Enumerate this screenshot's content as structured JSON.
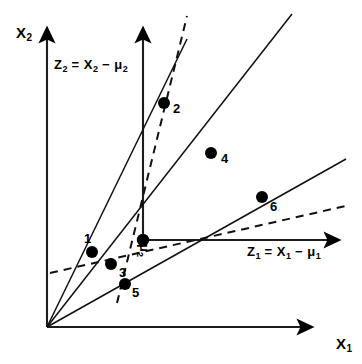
{
  "figure": {
    "background_color": "#ffffff",
    "stroke_color": "#000000",
    "point_color": "#000000"
  },
  "axes": {
    "x1": {
      "name": "X1",
      "label_main": "X",
      "label_sub": "1",
      "label_x": 336,
      "label_y": 336,
      "arrow_from": [
        47,
        327
      ],
      "arrow_to": [
        320,
        327
      ]
    },
    "x2": {
      "name": "X2",
      "label_main": "X",
      "label_sub": "2",
      "label_x": 16,
      "label_y": 25,
      "arrow_from": [
        47,
        327
      ],
      "arrow_to": [
        47,
        20
      ]
    },
    "z1": {
      "name": "Z1",
      "equation_parts": [
        "Z",
        "1",
        " = X",
        "1",
        " − μ",
        "1"
      ],
      "equation_text": "Z₁ = X₁ − μ₁",
      "label_x": 247,
      "label_y": 245,
      "arrow_from": [
        143,
        240
      ],
      "arrow_to": [
        347,
        240
      ]
    },
    "z2": {
      "name": "Z2",
      "equation_text": "Z₂ = X₂ − μ₂",
      "label_x": 54,
      "label_y": 58,
      "arrow_from": [
        143,
        240
      ],
      "arrow_to": [
        143,
        20
      ]
    }
  },
  "origin_marker": {
    "name": "mu-vector",
    "label_main": "μ",
    "label_sub": "2",
    "label_x": 148,
    "label_y": 247,
    "point": [
      143,
      240
    ]
  },
  "chart_data": {
    "type": "scatter",
    "xlabel": "X1",
    "ylabel": "X2",
    "grid": false,
    "legend": false,
    "points": [
      {
        "label": "1",
        "px": 92,
        "py": 252,
        "label_px": 84,
        "label_py": 232
      },
      {
        "label": "2",
        "px": 164,
        "py": 103,
        "label_px": 173,
        "label_py": 102
      },
      {
        "label": "3",
        "px": 111,
        "py": 264,
        "label_px": 119,
        "label_py": 266
      },
      {
        "label": "4",
        "px": 211,
        "py": 153,
        "label_px": 221,
        "label_py": 152
      },
      {
        "label": "5",
        "px": 125,
        "py": 284,
        "label_px": 132,
        "label_py": 286
      },
      {
        "label": "6",
        "px": 262,
        "py": 197,
        "label_px": 270,
        "label_py": 200
      }
    ],
    "point_radius": 6,
    "rays_from_x_origin": [
      {
        "name": "ray-to-point-2",
        "from": [
          47,
          327
        ],
        "to": [
          186,
          41
        ]
      },
      {
        "name": "ray-to-point-4",
        "from": [
          47,
          327
        ],
        "to": [
          290,
          16
        ]
      },
      {
        "name": "ray-to-point-6",
        "from": [
          47,
          327
        ],
        "to": [
          345,
          160
        ]
      }
    ],
    "solid_lines": [
      {
        "name": "line-through-1-2",
        "from": [
          47,
          327
        ],
        "to": [
          186,
          41
        ]
      },
      {
        "name": "line-through-4",
        "from": [
          47,
          327
        ],
        "to": [
          290,
          16
        ]
      },
      {
        "name": "line-through-3-6",
        "from": [
          47,
          327
        ],
        "to": [
          345,
          160
        ]
      }
    ],
    "dashed_lines": [
      {
        "name": "dashed-line-steep",
        "from": [
          117,
          302
        ],
        "to": [
          186,
          17
        ],
        "dash": "8 6"
      },
      {
        "name": "dashed-line-shallow",
        "from": [
          50,
          272
        ],
        "to": [
          348,
          206
        ],
        "dash": "8 6"
      }
    ]
  }
}
